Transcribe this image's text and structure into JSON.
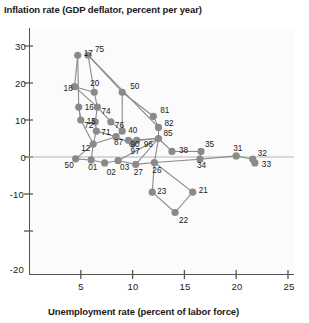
{
  "chart_data": {
    "type": "scatter",
    "title": "",
    "ylabel": "Inflation rate (GDP deflator, percent per year)",
    "xlabel": "Unemployment rate (percent of labor force)",
    "xlim": [
      0,
      26
    ],
    "ylim": [
      -22,
      32
    ],
    "xticks": [
      "5",
      "10",
      "15",
      "20",
      "25"
    ],
    "xtick_values": [
      5,
      10,
      15,
      20,
      25
    ],
    "yticks": [
      "30",
      "20",
      "10",
      "0",
      "-10",
      "-20"
    ],
    "ytick_values": [
      30,
      20,
      10,
      0,
      -10,
      -20
    ],
    "grid": false,
    "legend": "none",
    "connected": true,
    "series_name": "Year path",
    "point_color": "#8a8a8a",
    "line_color": "#8a8a8a",
    "axis_color": "#555555",
    "points": [
      {
        "label": "17",
        "x": 4.7,
        "y": 27.5
      },
      {
        "label": "18",
        "x": 4.4,
        "y": 19.0
      },
      {
        "label": "16",
        "x": 4.8,
        "y": 13.5
      },
      {
        "label": "15",
        "x": 5.0,
        "y": 10.0
      },
      {
        "label": "20",
        "x": 6.3,
        "y": 17.5
      },
      {
        "label": "75",
        "x": 5.7,
        "y": 27.5
      },
      {
        "label": "50",
        "x": 9.0,
        "y": 17.5
      },
      {
        "label": "74",
        "x": 6.6,
        "y": 13.5
      },
      {
        "label": "72",
        "x": 6.4,
        "y": 9.5
      },
      {
        "label": "76",
        "x": 7.9,
        "y": 9.5
      },
      {
        "label": "71",
        "x": 6.5,
        "y": 7.0
      },
      {
        "label": "40",
        "x": 9.0,
        "y": 7.0
      },
      {
        "label": "81",
        "x": 12.0,
        "y": 11.0
      },
      {
        "label": "82",
        "x": 12.5,
        "y": 8.0
      },
      {
        "label": "87",
        "x": 8.4,
        "y": 5.5
      },
      {
        "label": "90",
        "x": 9.6,
        "y": 4.5
      },
      {
        "label": "96",
        "x": 10.4,
        "y": 4.5
      },
      {
        "label": "97",
        "x": 10.0,
        "y": 3.5
      },
      {
        "label": "85",
        "x": 12.5,
        "y": 5.0
      },
      {
        "label": "12",
        "x": 6.2,
        "y": 3.5
      },
      {
        "label": "38",
        "x": 13.8,
        "y": 1.5
      },
      {
        "label": "35",
        "x": 16.6,
        "y": 1.5
      },
      {
        "label": "31",
        "x": 20.0,
        "y": 0.3
      },
      {
        "label": "32",
        "x": 21.6,
        "y": -0.6
      },
      {
        "label": "33",
        "x": 21.8,
        "y": -1.6
      },
      {
        "label": "34",
        "x": 16.5,
        "y": -0.6
      },
      {
        "label": "50b",
        "x": 4.5,
        "y": -0.5
      },
      {
        "label": "01",
        "x": 6.0,
        "y": -0.8
      },
      {
        "label": "02",
        "x": 7.3,
        "y": -1.6
      },
      {
        "label": "03",
        "x": 8.6,
        "y": -1.0
      },
      {
        "label": "27",
        "x": 10.3,
        "y": -2.0
      },
      {
        "label": "26",
        "x": 12.1,
        "y": -1.5
      },
      {
        "label": "23",
        "x": 11.9,
        "y": -9.5
      },
      {
        "label": "21",
        "x": 15.8,
        "y": -9.5
      },
      {
        "label": "22",
        "x": 14.1,
        "y": -15.0
      }
    ],
    "visible_point_labels": [
      "17",
      "18",
      "16",
      "15",
      "20",
      "75",
      "50",
      "74",
      "72",
      "76",
      "71",
      "40",
      "81",
      "82",
      "87",
      "90",
      "96",
      "97",
      "85",
      "12",
      "38",
      "35",
      "31",
      "32",
      "33",
      "34",
      "50",
      "01",
      "02",
      "03",
      "27",
      "26",
      "23",
      "21",
      "22"
    ]
  }
}
